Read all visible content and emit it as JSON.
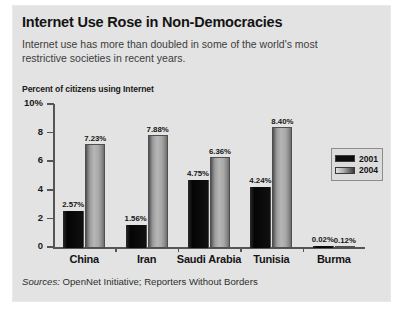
{
  "header": {
    "title": "Internet Use Rose in Non-Democracies",
    "subtitle": "Internet use has more than doubled in some of the world's most restrictive societies in recent years."
  },
  "footer": {
    "sources_word": "Sources:",
    "sources_text": " OpenNet Initiative; Reporters Without Borders"
  },
  "legend": {
    "position": "right",
    "entries": [
      {
        "label": "2001",
        "color": "#0d0d0d"
      },
      {
        "label": "2004",
        "color": "#b0b0b0"
      }
    ]
  },
  "chart_data": {
    "type": "bar",
    "title": "Internet Use Rose in Non-Democracies",
    "subtitle": "Internet use has more than doubled in some of the world's most restrictive societies in recent years.",
    "ylabel": "Percent of citizens using Internet",
    "xlabel": "",
    "ylim": [
      0,
      10
    ],
    "yticks": [
      0,
      2,
      4,
      6,
      8,
      10
    ],
    "ytick_labels": [
      "0",
      "2",
      "4",
      "6",
      "8",
      "10%"
    ],
    "grid": false,
    "categories": [
      "China",
      "Iran",
      "Saudi Arabia",
      "Tunisia",
      "Burma"
    ],
    "series": [
      {
        "name": "2001",
        "color": "#0d0d0d",
        "values": [
          2.57,
          1.56,
          4.75,
          4.24,
          0.02
        ],
        "labels": [
          "2.57%",
          "1.56%",
          "4.75%",
          "4.24%",
          "0.02%"
        ]
      },
      {
        "name": "2004",
        "color": "#b0b0b0",
        "values": [
          7.23,
          7.88,
          6.36,
          8.4,
          0.12
        ],
        "labels": [
          "7.23%",
          "7.88%",
          "6.36%",
          "8.40%",
          "0.12%"
        ]
      }
    ],
    "sources": "Sources: OpenNet Initiative; Reporters Without Borders"
  }
}
